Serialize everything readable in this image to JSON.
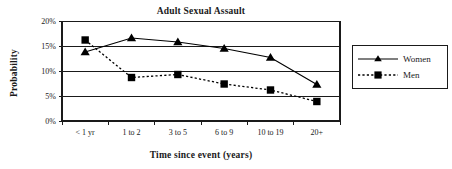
{
  "chart_data": {
    "type": "line",
    "title": "Adult Sexual Assault",
    "xlabel": "Time since event (years)",
    "ylabel": "Probability",
    "categories": [
      "< 1 yr",
      "1 to 2",
      "3 to 5",
      "6 to 9",
      "10 to 19",
      "20+"
    ],
    "ytick_labels": [
      "0%",
      "5%",
      "10%",
      "15%",
      "20%"
    ],
    "ytick_values": [
      0,
      5,
      10,
      15,
      20
    ],
    "ylim": [
      0,
      20
    ],
    "grid": "horizontal",
    "legend_position": "right-outside",
    "series": [
      {
        "name": "Women",
        "marker": "triangle",
        "line_style": "solid",
        "color": "#000000",
        "values": [
          13.8,
          16.6,
          15.8,
          14.5,
          12.7,
          7.3
        ]
      },
      {
        "name": "Men",
        "marker": "square",
        "line_style": "dotted",
        "color": "#000000",
        "values": [
          16.2,
          8.7,
          9.3,
          7.4,
          6.2,
          3.9
        ]
      }
    ]
  },
  "legend": {
    "entries": [
      {
        "label": "Women"
      },
      {
        "label": "Men"
      }
    ]
  }
}
